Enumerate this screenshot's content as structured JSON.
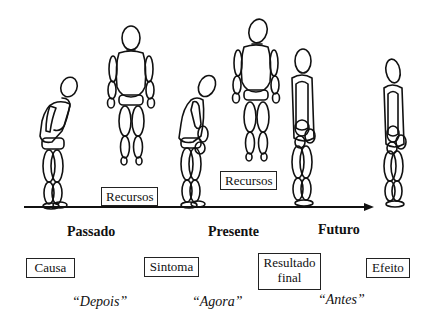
{
  "diagram": {
    "type": "timeline-with-figures",
    "timeline": {
      "direction": "left-to-right",
      "labels": [
        "Passado",
        "Presente",
        "Futuro"
      ]
    },
    "resource_boxes": [
      {
        "label": "Recursos"
      },
      {
        "label": "Recursos"
      }
    ],
    "stage_boxes": [
      {
        "label": "Causa"
      },
      {
        "label": "Sintoma"
      },
      {
        "label": "Resultado final"
      },
      {
        "label": "Efeito"
      }
    ],
    "quotes": [
      {
        "label": "“Depois”"
      },
      {
        "label": "“Agora”"
      },
      {
        "label": "“Antes”"
      }
    ],
    "figures": [
      {
        "pose": "bent-over-hand-on-face"
      },
      {
        "pose": "floating-upright"
      },
      {
        "pose": "bent-over-slouched"
      },
      {
        "pose": "floating-upright"
      },
      {
        "pose": "standing-hands-behind"
      },
      {
        "pose": "standing-hands-behind"
      }
    ],
    "colors": {
      "line": "#111111",
      "background": "#ffffff"
    }
  }
}
